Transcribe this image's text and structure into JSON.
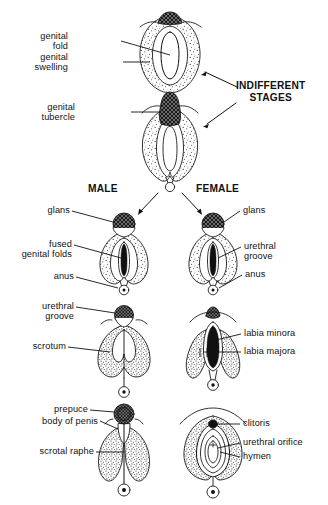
{
  "figure": {
    "ink_color": "#111111",
    "background_color": "#ffffff"
  },
  "stage_headings": {
    "indifferent": "INDIFFERENT\nSTAGES",
    "indifferent_line1": "INDIFFERENT",
    "indifferent_line2": "STAGES",
    "male": "MALE",
    "female": "FEMALE"
  },
  "labels": {
    "genital_fold": "genital\nfold",
    "genital_fold_line1": "genital",
    "genital_fold_line2": "fold",
    "genital_swelling": "genital\nswelling",
    "genital_swelling_line1": "genital",
    "genital_swelling_line2": "swelling",
    "genital_tubercle": "genital\ntubercle",
    "genital_tubercle_line1": "genital",
    "genital_tubercle_line2": "tubercle",
    "glans_male": "glans",
    "glans_female": "glans",
    "fused_genital_folds": "fused\ngenital folds",
    "fused_genital_folds_line1": "fused",
    "fused_genital_folds_line2": "genital folds",
    "anus_male": "anus",
    "anus_female": "anus",
    "urethral_groove_female_upper": "urethral\ngroove",
    "urethral_groove_female_upper_line1": "urethral",
    "urethral_groove_female_upper_line2": "groove",
    "urethral_groove_male": "urethral\ngroove",
    "urethral_groove_male_line1": "urethral",
    "urethral_groove_male_line2": "groove",
    "scrotum": "scrotum",
    "labia_minora": "labia minora",
    "labia_majora": "labia majora",
    "prepuce": "prepuce",
    "body_of_penis": "body of penis",
    "scrotal_raphe": "scrotal raphe",
    "clitoris": "clitoris",
    "urethral_orifice": "urethral orifice",
    "hymen": "hymen"
  }
}
